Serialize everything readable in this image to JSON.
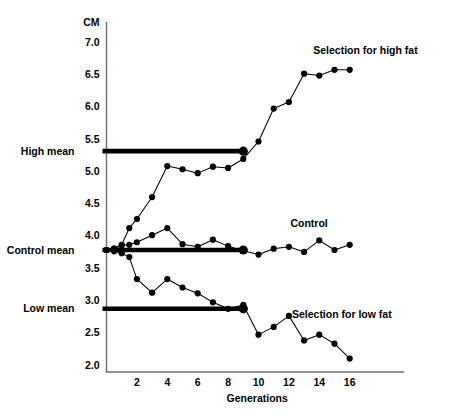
{
  "chart_data": {
    "type": "line",
    "title": "",
    "xlabel": "Generations",
    "ylabel": "CM",
    "unit_label": "CM",
    "xlim": [
      0,
      17.5
    ],
    "ylim": [
      2.0,
      7.25
    ],
    "grid": false,
    "legend_position": "inline-annotations",
    "xticks": [
      2,
      4,
      6,
      8,
      10,
      12,
      14,
      16
    ],
    "xtick_labels": [
      "2",
      "4",
      "6",
      "8",
      "10",
      "12",
      "14",
      "16"
    ],
    "yticks": [
      2.0,
      2.5,
      3.0,
      3.5,
      4.0,
      4.5,
      5.0,
      5.5,
      6.0,
      6.5,
      7.0
    ],
    "ytick_labels": [
      "2.0",
      "2.5",
      "3.0",
      "3.5",
      "4.0",
      "4.5",
      "5.0",
      "5.5",
      "6.0",
      "6.5",
      "7.0"
    ],
    "series": [
      {
        "name": "Selection for high fat",
        "annotation": "Selection for high fat",
        "annotation_x": 13.6,
        "annotation_y": 6.82,
        "x": [
          0,
          0.5,
          1,
          1.5,
          2,
          3,
          4,
          5,
          6,
          7,
          8,
          9,
          10,
          11,
          12,
          13,
          14,
          15,
          16
        ],
        "y": [
          3.78,
          3.8,
          3.86,
          4.12,
          4.26,
          4.6,
          5.08,
          5.03,
          4.97,
          5.07,
          5.05,
          5.19,
          5.46,
          5.97,
          6.07,
          6.51,
          6.48,
          6.57,
          6.57
        ]
      },
      {
        "name": "Control",
        "annotation": "Control",
        "annotation_x": 12.1,
        "annotation_y": 4.13,
        "x": [
          0,
          0.5,
          1,
          1.5,
          2,
          3,
          4,
          5,
          6,
          7,
          8,
          9,
          10,
          11,
          12,
          13,
          14,
          15,
          16
        ],
        "y": [
          3.78,
          3.8,
          3.85,
          3.86,
          3.9,
          4.01,
          4.12,
          3.87,
          3.83,
          3.94,
          3.84,
          3.77,
          3.71,
          3.8,
          3.83,
          3.75,
          3.93,
          3.78,
          3.86
        ]
      },
      {
        "name": "Selection for low fat",
        "annotation": "Selection for low fat",
        "annotation_x": 12.2,
        "annotation_y": 2.72,
        "x": [
          0,
          0.5,
          1,
          1.5,
          2,
          3,
          4,
          5,
          6,
          7,
          8,
          9,
          10,
          11,
          12,
          13,
          14,
          15,
          16
        ],
        "y": [
          3.78,
          3.76,
          3.73,
          3.67,
          3.33,
          3.12,
          3.33,
          3.2,
          3.11,
          2.97,
          2.87,
          2.93,
          2.47,
          2.59,
          2.76,
          2.38,
          2.47,
          2.33,
          2.1
        ]
      }
    ],
    "reference_lines": [
      {
        "label": "High mean",
        "value": 5.31,
        "x_start": 0,
        "x_end": 9.0,
        "end_marker": true
      },
      {
        "label": "Control mean",
        "value": 3.78,
        "x_start": 0,
        "x_end": 9.0,
        "end_marker": true
      },
      {
        "label": "Low mean",
        "value": 2.87,
        "x_start": 0,
        "x_end": 9.0,
        "end_marker": true
      }
    ],
    "colors": {
      "line": "#000000",
      "marker": "#000000",
      "axis": "#6f6f6f",
      "reference": "#000000",
      "background": "#ffffff"
    }
  }
}
